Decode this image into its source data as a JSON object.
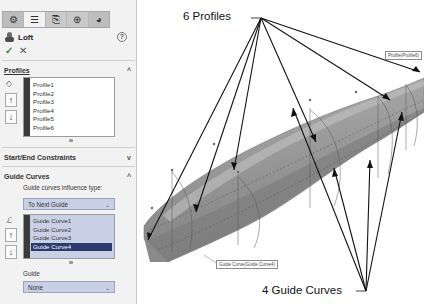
{
  "panel": {
    "tabs": [
      {
        "name": "feature-manager",
        "glyph": "⚙"
      },
      {
        "name": "property-manager",
        "glyph": "☰"
      },
      {
        "name": "configuration-manager",
        "glyph": "⎘"
      },
      {
        "name": "dimxpert-manager",
        "glyph": "⊕"
      },
      {
        "name": "display-manager",
        "glyph": "◕"
      }
    ],
    "feature_title": "Loft",
    "help_glyph": "?",
    "ok_glyph": "✓",
    "cancel_glyph": "✕",
    "profiles": {
      "header": "Profiles",
      "chevron": "^",
      "items": [
        "Profile1",
        "Profile2",
        "Profile3",
        "Profile4",
        "Profile5",
        "Profile6"
      ]
    },
    "start_end": {
      "header": "Start/End Constraints",
      "chevron": "v"
    },
    "guide_curves": {
      "header": "Guide Curves",
      "chevron": "^",
      "influence_label": "Guide curves influence type:",
      "influence_value": "To Next Guide",
      "items": [
        "Guide Curve1",
        "Guide Curve2",
        "Guide Curve3",
        "Guide Curve4"
      ],
      "selected_index": 3,
      "guide_label": "Guide",
      "guide_value": "None"
    },
    "buttons": {
      "up": "🡅",
      "down": "🡇",
      "up_text": "↑",
      "down_text": "↓"
    }
  },
  "viewport": {
    "callout_profiles": "6 Profiles",
    "callout_guides": "4 Guide Curves",
    "tag_top": "Profile(Profile6)",
    "tag_bottom": "Guide Curve(Guide Curve4)"
  },
  "colors": {
    "panel_bg": "#f2f2f2",
    "selection": "#2e3a6e",
    "list_highlight": "#c9d0e6",
    "body_gray": "#9a9a9a"
  }
}
